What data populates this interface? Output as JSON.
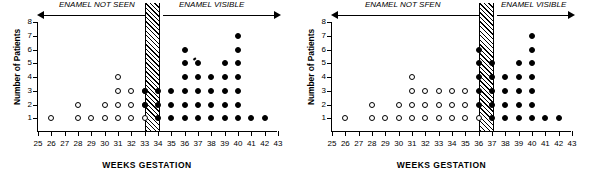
{
  "figure": {
    "panels": [
      {
        "id": "left-panel",
        "xlabel": "WEEKS GESTATION",
        "ylabel": "Number of Patients",
        "annotations": {
          "not_seen": "ENAMEL NOT SEEN",
          "visible": "ENAMEL VISIBLE"
        },
        "band": {
          "start": 33,
          "end": 34
        }
      },
      {
        "id": "right-panel",
        "xlabel": "WEEKS GESTATION",
        "ylabel": "Number of Patients",
        "annotations": {
          "not_seen": "ENAMEL NOT SFEN",
          "visible": "ENAMEL VISIBLE"
        },
        "band": {
          "start": 36,
          "end": 37
        }
      }
    ]
  },
  "chart_data": [
    {
      "type": "scatter",
      "id": "left-panel",
      "title": "",
      "xlabel": "WEEKS GESTATION",
      "ylabel": "Number of Patients",
      "xlim": [
        25,
        43
      ],
      "ylim": [
        0,
        8
      ],
      "xticks": [
        25,
        26,
        27,
        28,
        29,
        30,
        31,
        32,
        33,
        34,
        35,
        36,
        37,
        38,
        39,
        40,
        41,
        42,
        43
      ],
      "yticks": [
        1,
        2,
        3,
        4,
        5,
        6,
        7,
        8
      ],
      "grid": false,
      "legend": null,
      "transition_band": {
        "start": 33,
        "end": 34,
        "style": "hatched"
      },
      "annotations": [
        {
          "text": "ENAMEL NOT SEEN",
          "direction": "left",
          "x_from": 33,
          "x_to": 25
        },
        {
          "text": "ENAMEL VISIBLE",
          "direction": "right",
          "x_from": 34,
          "x_to": 43
        }
      ],
      "series": [
        {
          "name": "Enamel not seen",
          "marker": "open-circle",
          "points": [
            {
              "x": 26,
              "y": 1
            },
            {
              "x": 28,
              "y": 1
            },
            {
              "x": 28,
              "y": 2
            },
            {
              "x": 29,
              "y": 1
            },
            {
              "x": 30,
              "y": 1
            },
            {
              "x": 30,
              "y": 2
            },
            {
              "x": 31,
              "y": 1
            },
            {
              "x": 31,
              "y": 2
            },
            {
              "x": 31,
              "y": 3
            },
            {
              "x": 31,
              "y": 4
            },
            {
              "x": 32,
              "y": 1
            },
            {
              "x": 32,
              "y": 2
            },
            {
              "x": 32,
              "y": 3
            },
            {
              "x": 33,
              "y": 1
            },
            {
              "x": 33,
              "y": 2
            },
            {
              "x": 33,
              "y": 3
            }
          ]
        },
        {
          "name": "Enamel visible",
          "marker": "filled-circle",
          "points": [
            {
              "x": 33,
              "y": 2
            },
            {
              "x": 33,
              "y": 3
            },
            {
              "x": 34,
              "y": 1
            },
            {
              "x": 34,
              "y": 2
            },
            {
              "x": 34,
              "y": 3
            },
            {
              "x": 35,
              "y": 1
            },
            {
              "x": 35,
              "y": 2
            },
            {
              "x": 35,
              "y": 3
            },
            {
              "x": 36,
              "y": 1
            },
            {
              "x": 36,
              "y": 2
            },
            {
              "x": 36,
              "y": 3
            },
            {
              "x": 36,
              "y": 4
            },
            {
              "x": 36,
              "y": 5
            },
            {
              "x": 36,
              "y": 6
            },
            {
              "x": 37,
              "y": 1
            },
            {
              "x": 37,
              "y": 2
            },
            {
              "x": 37,
              "y": 3
            },
            {
              "x": 37,
              "y": 4
            },
            {
              "x": 37,
              "y": 5
            },
            {
              "x": 38,
              "y": 1
            },
            {
              "x": 38,
              "y": 2
            },
            {
              "x": 38,
              "y": 3
            },
            {
              "x": 38,
              "y": 4
            },
            {
              "x": 39,
              "y": 1
            },
            {
              "x": 39,
              "y": 2
            },
            {
              "x": 39,
              "y": 3
            },
            {
              "x": 39,
              "y": 4
            },
            {
              "x": 39,
              "y": 5
            },
            {
              "x": 40,
              "y": 1
            },
            {
              "x": 40,
              "y": 2
            },
            {
              "x": 40,
              "y": 3
            },
            {
              "x": 40,
              "y": 4
            },
            {
              "x": 40,
              "y": 5
            },
            {
              "x": 40,
              "y": 6
            },
            {
              "x": 40,
              "y": 7
            },
            {
              "x": 41,
              "y": 1
            },
            {
              "x": 42,
              "y": 1
            }
          ]
        }
      ]
    },
    {
      "type": "scatter",
      "id": "right-panel",
      "title": "",
      "xlabel": "WEEKS GESTATION",
      "ylabel": "Number of Patients",
      "xlim": [
        25,
        43
      ],
      "ylim": [
        0,
        8
      ],
      "xticks": [
        25,
        26,
        27,
        28,
        29,
        30,
        31,
        32,
        33,
        34,
        35,
        36,
        37,
        38,
        39,
        40,
        41,
        42,
        43
      ],
      "yticks": [
        1,
        2,
        3,
        4,
        5,
        6,
        7,
        8
      ],
      "grid": false,
      "legend": null,
      "transition_band": {
        "start": 36,
        "end": 37,
        "style": "hatched"
      },
      "annotations": [
        {
          "text": "ENAMEL NOT SFEN",
          "direction": "left",
          "x_from": 36,
          "x_to": 25
        },
        {
          "text": "ENAMEL VISIBLE",
          "direction": "right",
          "x_from": 37,
          "x_to": 43
        }
      ],
      "series": [
        {
          "name": "Enamel not seen",
          "marker": "open-circle",
          "points": [
            {
              "x": 26,
              "y": 1
            },
            {
              "x": 28,
              "y": 1
            },
            {
              "x": 28,
              "y": 2
            },
            {
              "x": 29,
              "y": 1
            },
            {
              "x": 30,
              "y": 1
            },
            {
              "x": 30,
              "y": 2
            },
            {
              "x": 31,
              "y": 1
            },
            {
              "x": 31,
              "y": 2
            },
            {
              "x": 31,
              "y": 3
            },
            {
              "x": 31,
              "y": 4
            },
            {
              "x": 32,
              "y": 1
            },
            {
              "x": 32,
              "y": 2
            },
            {
              "x": 32,
              "y": 3
            },
            {
              "x": 33,
              "y": 1
            },
            {
              "x": 33,
              "y": 2
            },
            {
              "x": 33,
              "y": 3
            },
            {
              "x": 34,
              "y": 1
            },
            {
              "x": 34,
              "y": 2
            },
            {
              "x": 34,
              "y": 3
            },
            {
              "x": 35,
              "y": 1
            },
            {
              "x": 35,
              "y": 2
            },
            {
              "x": 35,
              "y": 3
            },
            {
              "x": 36,
              "y": 1
            }
          ]
        },
        {
          "name": "Enamel visible",
          "marker": "filled-circle",
          "points": [
            {
              "x": 36,
              "y": 2
            },
            {
              "x": 36,
              "y": 3
            },
            {
              "x": 36,
              "y": 4
            },
            {
              "x": 36,
              "y": 5
            },
            {
              "x": 36,
              "y": 6
            },
            {
              "x": 37,
              "y": 1
            },
            {
              "x": 37,
              "y": 2
            },
            {
              "x": 37,
              "y": 3
            },
            {
              "x": 37,
              "y": 4
            },
            {
              "x": 37,
              "y": 5
            },
            {
              "x": 38,
              "y": 1
            },
            {
              "x": 38,
              "y": 2
            },
            {
              "x": 38,
              "y": 3
            },
            {
              "x": 38,
              "y": 4
            },
            {
              "x": 39,
              "y": 1
            },
            {
              "x": 39,
              "y": 2
            },
            {
              "x": 39,
              "y": 3
            },
            {
              "x": 39,
              "y": 4
            },
            {
              "x": 39,
              "y": 5
            },
            {
              "x": 40,
              "y": 1
            },
            {
              "x": 40,
              "y": 2
            },
            {
              "x": 40,
              "y": 3
            },
            {
              "x": 40,
              "y": 4
            },
            {
              "x": 40,
              "y": 5
            },
            {
              "x": 40,
              "y": 6
            },
            {
              "x": 40,
              "y": 7
            },
            {
              "x": 41,
              "y": 1
            },
            {
              "x": 42,
              "y": 1
            }
          ]
        }
      ]
    }
  ]
}
